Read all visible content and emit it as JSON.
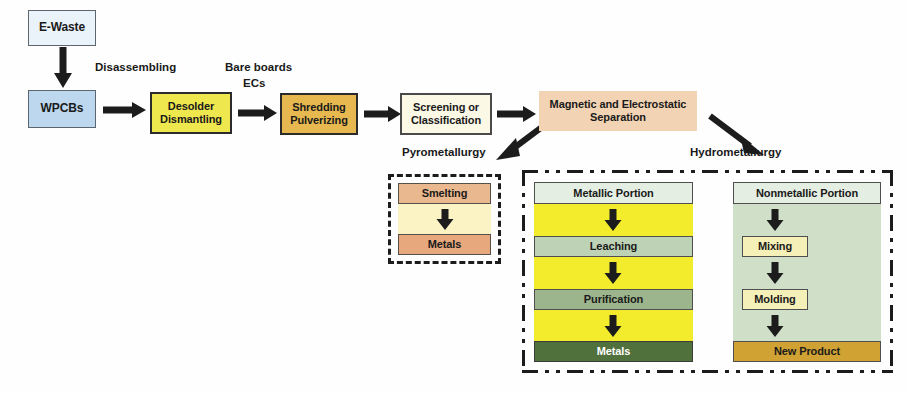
{
  "diagram": {
    "colors": {
      "ewaste_fill": "#eaf2fa",
      "wpcbs_fill": "#bcd7ee",
      "desolder_fill": "#efe74e",
      "shredding_fill": "#e6b84f",
      "screening_fill": "#fbf8e6",
      "magsep_fill": "#f2d3b3",
      "pyro_panel_fill": "#fbf3c4",
      "smelting_fill": "#eab88f",
      "pyro_metals_fill": "#e6a87c",
      "metallic_panel_fill": "#f2ec2c",
      "nonmetallic_panel_fill": "#cfdfc8",
      "metals_fill": "#50703c",
      "new_product_fill": "#cfa233",
      "arrow_color": "#1c1c1c",
      "dash_color": "#1c1c1c"
    },
    "main_flow": {
      "ewaste": {
        "label": "E-Waste"
      },
      "wpcbs": {
        "label": "WPCBs"
      },
      "desolder": {
        "line1": "Desolder",
        "line2": "Dismantling"
      },
      "shredding": {
        "line1": "Shredding",
        "line2": "Pulverizing"
      },
      "screening": {
        "line1": "Screening or",
        "line2": "Classification"
      },
      "magsep": {
        "line1": "Magnetic and Electrostatic",
        "line2": "Separation"
      }
    },
    "edge_labels": {
      "disassembling": "Disassembling",
      "bare_boards": "Bare boards",
      "ecs": "ECs",
      "pyrometallurgy": "Pyrometallurgy",
      "hydrometallurgy": "Hydrometallurgy"
    },
    "pyrometallurgy_branch": {
      "steps": [
        {
          "label": "Smelting"
        },
        {
          "label": "Metals"
        }
      ]
    },
    "hydrometallurgy_branch": {
      "metallic_column": {
        "steps": [
          {
            "label": "Metallic Portion"
          },
          {
            "label": "Leaching"
          },
          {
            "label": "Purification"
          },
          {
            "label": "Metals"
          }
        ]
      },
      "nonmetallic_column": {
        "steps": [
          {
            "label": "Nonmetallic Portion"
          },
          {
            "label": "Mixing"
          },
          {
            "label": "Molding"
          },
          {
            "label": "New Product"
          }
        ]
      }
    }
  }
}
